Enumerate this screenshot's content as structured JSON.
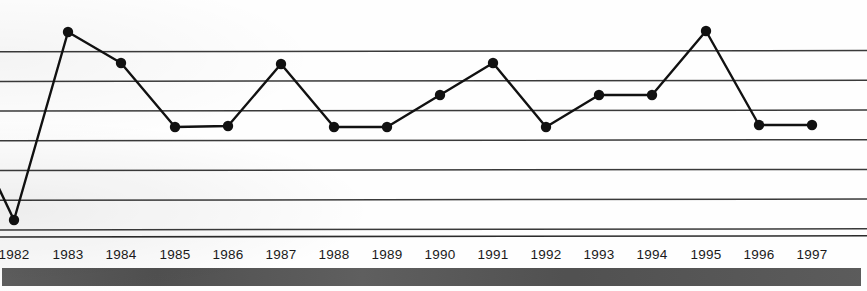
{
  "chart_data": {
    "type": "line",
    "title": "",
    "subtitle": "",
    "xlabel": "",
    "ylabel": "",
    "grid": true,
    "gridlines_count": 7,
    "legend": "none",
    "axis_line_visible": true,
    "y_axis_labels_visible": false,
    "ylim": [
      0,
      7
    ],
    "y_gridline_values": [
      7,
      6,
      5,
      4,
      3,
      2,
      1
    ],
    "categories": [
      "1982",
      "1983",
      "1984",
      "1985",
      "1986",
      "1987",
      "1988",
      "1989",
      "1990",
      "1991",
      "1992",
      "1993",
      "1994",
      "1995",
      "1996",
      "1997"
    ],
    "values": [
      0.55,
      6.65,
      5.55,
      3.4,
      3.45,
      5.5,
      3.4,
      3.4,
      4.5,
      5.5,
      3.4,
      4.5,
      4.5,
      6.7,
      3.5,
      3.5
    ],
    "marker": "filled-circle",
    "marker_color": "#111111",
    "line_color": "#111111",
    "line_width": 2.4,
    "has_leading_partial_segment": true,
    "series": [
      {
        "name": "series-1",
        "values": [
          0.55,
          6.65,
          5.55,
          3.4,
          3.45,
          5.5,
          3.4,
          3.4,
          4.5,
          5.5,
          3.4,
          4.5,
          4.5,
          6.7,
          3.5,
          3.5
        ]
      }
    ]
  },
  "chart": {
    "background_color": "#ffffff",
    "gridline_color": "#3a3a3a",
    "axis_color": "#2b2b2b",
    "label_color": "#1a1a1a",
    "footer_bar_color": "#555555",
    "point_pixels": [
      {
        "year": "1982",
        "x": 14,
        "y": 220
      },
      {
        "year": "1983",
        "x": 68,
        "y": 32
      },
      {
        "year": "1984",
        "x": 121,
        "y": 63
      },
      {
        "year": "1985",
        "x": 175,
        "y": 127
      },
      {
        "year": "1986",
        "x": 228,
        "y": 126
      },
      {
        "year": "1987",
        "x": 281,
        "y": 64
      },
      {
        "year": "1988",
        "x": 334,
        "y": 127
      },
      {
        "year": "1989",
        "x": 387,
        "y": 127
      },
      {
        "year": "1990",
        "x": 440,
        "y": 95
      },
      {
        "year": "1991",
        "x": 493,
        "y": 63
      },
      {
        "year": "1992",
        "x": 546,
        "y": 127
      },
      {
        "year": "1993",
        "x": 599,
        "y": 95
      },
      {
        "year": "1994",
        "x": 652,
        "y": 95
      },
      {
        "year": "1995",
        "x": 706,
        "y": 31
      },
      {
        "year": "1996",
        "x": 759,
        "y": 125
      },
      {
        "year": "1997",
        "x": 812,
        "y": 125
      }
    ],
    "gridline_y_pixels": [
      51.7,
      81.4,
      111.1,
      140.8,
      170.5,
      200.2,
      229.9
    ],
    "axis_y_pixel": 237,
    "leading_segment": {
      "from_x": -6,
      "from_y": 178,
      "to_x": 14,
      "to_y": 220
    }
  },
  "footer": {
    "label": ""
  }
}
